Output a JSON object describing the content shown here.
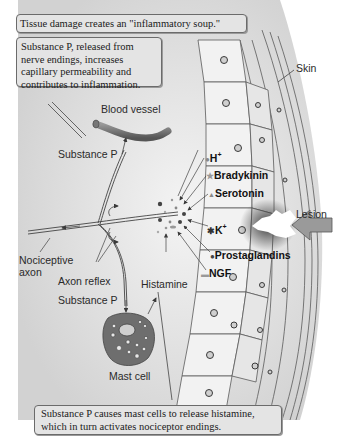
{
  "figure": {
    "callouts": {
      "top": "Tissue damage creates an \"inflammatory soup.\"",
      "substance_p_box": "Substance P, released from nerve endings, increases capillary permeability and contributes to inflammation.",
      "bottom": "Substance P causes mast cells to release histamine, which in turn activates nociceptor endings."
    },
    "labels": {
      "skin": "Skin",
      "blood_vessel": "Blood vessel",
      "substance_p_upper": "Substance P",
      "nociceptive_axon_line1": "Nociceptive",
      "nociceptive_axon_line2": "axon",
      "axon_reflex": "Axon reflex",
      "substance_p_lower": "Substance P",
      "histamine": "Histamine",
      "mast_cell": "Mast cell",
      "lesion": "Lesion"
    },
    "mediators": [
      {
        "id": "h",
        "label": "H",
        "sup": "+"
      },
      {
        "id": "bradykinin",
        "label": "Bradykinin",
        "sup": ""
      },
      {
        "id": "serotonin",
        "label": "Serotonin",
        "sup": ""
      },
      {
        "id": "k",
        "label": "K",
        "sup": "+"
      },
      {
        "id": "prostaglandins",
        "label": "Prostaglandins",
        "sup": ""
      },
      {
        "id": "ngf",
        "label": "NGF",
        "sup": ""
      }
    ],
    "colors": {
      "background": "#ffffff",
      "tissue_gray": "#dcdcdc",
      "cell_fill": "#f2f2f2",
      "outline": "#5a5a5a",
      "callout_fill": "#e4e4e4",
      "mast_cell": "#6e6e6e",
      "arrow": "#8a8a8a"
    }
  }
}
